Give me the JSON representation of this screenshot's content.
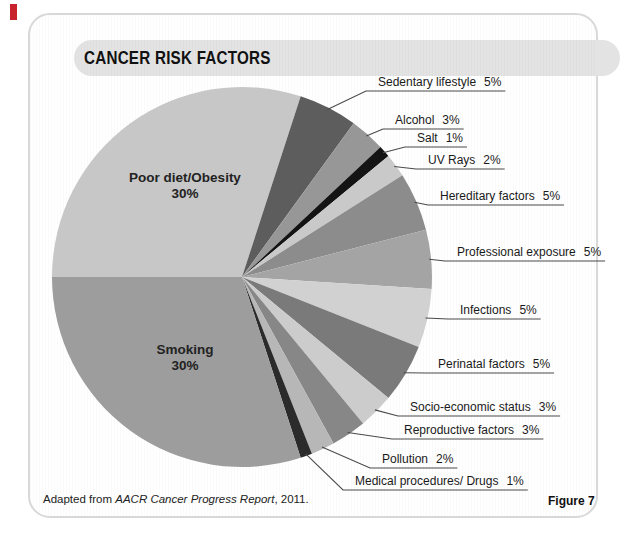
{
  "header": {
    "title": "CANCER RISK FACTORS"
  },
  "footer": {
    "source_prefix": "Adapted from ",
    "source_italic": "AACR Cancer Progress Report",
    "source_suffix": ", 2011.",
    "figure_label": "Figure 7"
  },
  "colors": {
    "panel_border": "#d8d8d8",
    "header_bar": "#e3e3e3",
    "leader_line": "#4a4a4a",
    "red_edge_mark": "#c8232c"
  },
  "chart_data": {
    "type": "pie",
    "title": "CANCER RISK FACTORS",
    "start_angle_deg": 180,
    "direction": "clockwise",
    "center": [
      242,
      277
    ],
    "radius": 190,
    "legend_position": "none",
    "slices": [
      {
        "label": "Poor diet/Obesity",
        "pct": "30%",
        "value": 30,
        "color": "#c7c7c7",
        "label_placement": "inside"
      },
      {
        "label": "Sedentary lifestyle",
        "pct": "5%",
        "value": 5,
        "color": "#5d5d5d",
        "label_placement": "outside"
      },
      {
        "label": "Alcohol",
        "pct": "3%",
        "value": 3,
        "color": "#979797",
        "label_placement": "outside"
      },
      {
        "label": "Salt",
        "pct": "1%",
        "value": 1,
        "color": "#141414",
        "label_placement": "outside"
      },
      {
        "label": "UV Rays",
        "pct": "2%",
        "value": 2,
        "color": "#c9c9c9",
        "label_placement": "outside"
      },
      {
        "label": "Hereditary factors",
        "pct": "5%",
        "value": 5,
        "color": "#8c8c8c",
        "label_placement": "outside"
      },
      {
        "label": "Professional exposure",
        "pct": "5%",
        "value": 5,
        "color": "#a4a4a4",
        "label_placement": "outside"
      },
      {
        "label": "Infections",
        "pct": "5%",
        "value": 5,
        "color": "#d1d1d1",
        "label_placement": "outside"
      },
      {
        "label": "Perinatal factors",
        "pct": "5%",
        "value": 5,
        "color": "#7a7a7a",
        "label_placement": "outside"
      },
      {
        "label": "Socio-economic status",
        "pct": "3%",
        "value": 3,
        "color": "#cccccc",
        "label_placement": "outside"
      },
      {
        "label": "Reproductive factors",
        "pct": "3%",
        "value": 3,
        "color": "#878787",
        "label_placement": "outside"
      },
      {
        "label": "Pollution",
        "pct": "2%",
        "value": 2,
        "color": "#b7b7b7",
        "label_placement": "outside"
      },
      {
        "label": "Medical procedures/ Drugs",
        "pct": "1%",
        "value": 1,
        "color": "#2b2b2b",
        "label_placement": "outside"
      },
      {
        "label": "Smoking",
        "pct": "30%",
        "value": 30,
        "color": "#9d9d9d",
        "label_placement": "inside"
      }
    ]
  }
}
